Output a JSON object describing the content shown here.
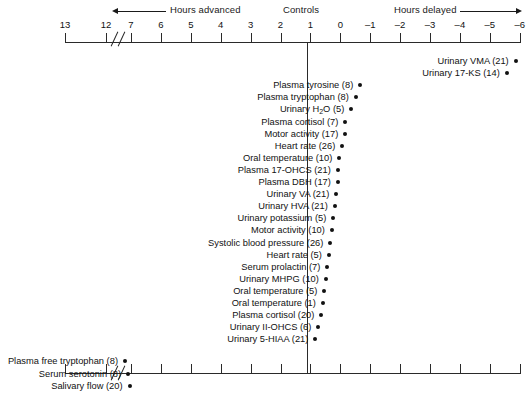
{
  "chart_data": {
    "type": "scatter",
    "title": "",
    "xlabel": "Hours advanced / Hours delayed relative to Controls",
    "ylabel": "",
    "axis": {
      "tick_labels": [
        "13",
        "12",
        "7",
        "6",
        "5",
        "4",
        "3",
        "2",
        "1",
        "0",
        "–1",
        "–2",
        "–3",
        "–4",
        "–5",
        "–6"
      ],
      "tick_values": [
        13,
        12,
        7,
        6,
        5,
        4,
        3,
        2,
        1,
        0,
        -1,
        -2,
        -3,
        -4,
        -5,
        -6
      ],
      "has_axis_break": true,
      "break_between": [
        "12",
        "7"
      ],
      "grid": false,
      "top_axis": true,
      "bottom_axis": true,
      "zero_reference_line": true
    },
    "headers": {
      "advanced": "Hours advanced",
      "controls": "Controls",
      "delayed": "Hours delayed"
    },
    "points": [
      {
        "label": "Urinary VMA (21)",
        "variable": "Urinary VMA",
        "n": 21,
        "hours": -5.8
      },
      {
        "label": "Urinary 17-KS (14)",
        "variable": "Urinary 17-KS",
        "n": 14,
        "hours": -5.5
      },
      {
        "label": "Plasma tyrosine (8)",
        "variable": "Plasma tyrosine",
        "n": 8,
        "hours": -0.6
      },
      {
        "label": "Plasma tryptophan (8)",
        "variable": "Plasma tryptophan",
        "n": 8,
        "hours": -0.45
      },
      {
        "label": "Urinary H₂O (5)",
        "variable": "Urinary H2O",
        "n": 5,
        "hours": -0.3
      },
      {
        "label": "Plasma cortisol (7)",
        "variable": "Plasma cortisol",
        "n": 7,
        "hours": -0.1
      },
      {
        "label": "Motor activity (17)",
        "variable": "Motor activity",
        "n": 17,
        "hours": -0.1
      },
      {
        "label": "Heart rate (26)",
        "variable": "Heart rate",
        "n": 26,
        "hours": 0.0
      },
      {
        "label": "Oral temperature (10)",
        "variable": "Oral temperature",
        "n": 10,
        "hours": 0.1
      },
      {
        "label": "Plasma 17-OHCS (21)",
        "variable": "Plasma 17-OHCS",
        "n": 21,
        "hours": 0.15
      },
      {
        "label": "Plasma DBH (17)",
        "variable": "Plasma DBH",
        "n": 17,
        "hours": 0.15
      },
      {
        "label": "Urinary VA (21)",
        "variable": "Urinary VA",
        "n": 21,
        "hours": 0.2
      },
      {
        "label": "Urinary HVA (21)",
        "variable": "Urinary HVA",
        "n": 21,
        "hours": 0.25
      },
      {
        "label": "Urinary potassium (5)",
        "variable": "Urinary potassium",
        "n": 5,
        "hours": 0.3
      },
      {
        "label": "Motor activity (10)",
        "variable": "Motor activity",
        "n": 10,
        "hours": 0.35
      },
      {
        "label": "Systolic blood pressure (26)",
        "variable": "Systolic blood pressure",
        "n": 26,
        "hours": 0.4
      },
      {
        "label": "Heart rate (5)",
        "variable": "Heart rate",
        "n": 5,
        "hours": 0.45
      },
      {
        "label": "Serum prolactin (7)",
        "variable": "Serum prolactin",
        "n": 7,
        "hours": 0.5
      },
      {
        "label": "Urinary MHPG (10)",
        "variable": "Urinary MHPG",
        "n": 10,
        "hours": 0.55
      },
      {
        "label": "Oral temperature (5)",
        "variable": "Oral temperature",
        "n": 5,
        "hours": 0.6
      },
      {
        "label": "Oral temperature (1)",
        "variable": "Oral temperature",
        "n": 1,
        "hours": 0.65
      },
      {
        "label": "Plasma cortisol (20)",
        "variable": "Plasma cortisol",
        "n": 20,
        "hours": 0.7
      },
      {
        "label": "Urinary II-OHCS (6)",
        "variable": "Urinary II-OHCS",
        "n": 6,
        "hours": 0.8
      },
      {
        "label": "Urinary 5-HIAA (21)",
        "variable": "Urinary 5-HIAA",
        "n": 21,
        "hours": 0.9
      },
      {
        "label": "Plasma free tryptophan (8)",
        "variable": "Plasma free tryptophan",
        "n": 8,
        "hours": 8.6
      },
      {
        "label": "Serum serotonin (8)",
        "variable": "Serum serotonin",
        "n": 8,
        "hours": 8.0
      },
      {
        "label": "Salivary flow (20)",
        "variable": "Salivary flow",
        "n": 20,
        "hours": 7.7
      }
    ]
  }
}
